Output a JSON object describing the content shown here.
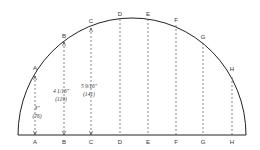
{
  "diagram": {
    "title": "",
    "stations": [
      {
        "label": "A",
        "x": 35,
        "top_y": 76,
        "top_label_y": 70
      },
      {
        "label": "B",
        "x": 64,
        "top_y": 42,
        "top_label_y": 38
      },
      {
        "label": "C",
        "x": 91,
        "top_y": 28,
        "top_label_y": 23
      },
      {
        "label": "D",
        "x": 120,
        "top_y": 19,
        "top_label_y": 16
      },
      {
        "label": "E",
        "x": 148,
        "top_y": 19,
        "top_label_y": 16
      },
      {
        "label": "F",
        "x": 176,
        "top_y": 25,
        "top_label_y": 22
      },
      {
        "label": "G",
        "x": 203,
        "top_y": 43,
        "top_label_y": 39
      },
      {
        "label": "H",
        "x": 232,
        "top_y": 77,
        "top_label_y": 71
      }
    ],
    "dimensions": [
      {
        "station": "A",
        "value": "3\"",
        "metric": "(76)",
        "x": 37,
        "y": 110
      },
      {
        "station": "B",
        "value": "4 1/16\"",
        "metric": "(119)",
        "x": 61,
        "y": 93
      },
      {
        "station": "C",
        "value": "5 9/16\"",
        "metric": "(141)",
        "x": 89,
        "y": 88
      }
    ],
    "colors": {
      "line": "#222222",
      "dashed": "#555555",
      "text": "#333333"
    }
  }
}
